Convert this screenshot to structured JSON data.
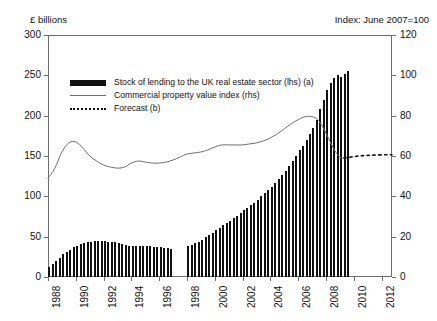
{
  "chart_data": {
    "type": "bar",
    "title": "",
    "left_axis_title": "£ billions",
    "right_axis_title": "Index: June 2007=100",
    "xlabel": "",
    "grid": false,
    "legend_position": "inside-top-left",
    "xlim": [
      1988,
      2012.75
    ],
    "ylim_left": [
      0,
      300
    ],
    "ylim_right": [
      0,
      120
    ],
    "left_ticks": [
      "0",
      "50",
      "100",
      "150",
      "200",
      "250",
      "300"
    ],
    "left_tick_values": [
      0,
      50,
      100,
      150,
      200,
      250,
      300
    ],
    "right_ticks": [
      "0",
      "20",
      "40",
      "60",
      "80",
      "100",
      "120"
    ],
    "right_tick_values": [
      0,
      20,
      40,
      60,
      80,
      100,
      120
    ],
    "x_ticks": [
      "1988",
      "1990",
      "1992",
      "1994",
      "1996",
      "1998",
      "2000",
      "2002",
      "2004",
      "2006",
      "2008",
      "2010",
      "2012"
    ],
    "x_tick_values": [
      1988,
      1990,
      1992,
      1994,
      1996,
      1998,
      2000,
      2002,
      2004,
      2006,
      2008,
      2010,
      2012
    ],
    "legend": [
      {
        "label": "Stock of lending to the UK real estate sector (lhs) (a)",
        "key": "bar-swatch"
      },
      {
        "label": "Commercial property value index (rhs)",
        "key": "line-swatch"
      },
      {
        "label": "Forecast (b)",
        "key": "dash-swatch"
      }
    ],
    "series": [
      {
        "name": "Stock of lending to the UK real estate sector (lhs) (a)",
        "type": "bar",
        "axis": "left",
        "units": "£ billions",
        "color": "#111111",
        "x": [
          1988.1,
          1988.35,
          1988.6,
          1988.85,
          1989.1,
          1989.35,
          1989.6,
          1989.85,
          1990.1,
          1990.35,
          1990.6,
          1990.85,
          1991.1,
          1991.35,
          1991.6,
          1991.85,
          1992.1,
          1992.35,
          1992.6,
          1992.85,
          1993.1,
          1993.35,
          1993.6,
          1993.85,
          1994.1,
          1994.35,
          1994.6,
          1994.85,
          1995.1,
          1995.35,
          1995.6,
          1995.85,
          1996.1,
          1996.35,
          1996.6,
          1996.85,
          1998.1,
          1998.35,
          1998.6,
          1998.85,
          1999.1,
          1999.35,
          1999.6,
          1999.85,
          2000.1,
          2000.35,
          2000.6,
          2000.85,
          2001.1,
          2001.35,
          2001.6,
          2001.85,
          2002.1,
          2002.35,
          2002.6,
          2002.85,
          2003.1,
          2003.35,
          2003.6,
          2003.85,
          2004.1,
          2004.35,
          2004.6,
          2004.85,
          2005.1,
          2005.35,
          2005.6,
          2005.85,
          2006.1,
          2006.35,
          2006.6,
          2006.85,
          2007.1,
          2007.35,
          2007.6,
          2007.85,
          2008.1,
          2008.35,
          2008.6,
          2008.85,
          2009.1,
          2009.35,
          2009.6
        ],
        "values": [
          12,
          16,
          20,
          24,
          28,
          31,
          34,
          37,
          39,
          41,
          42,
          43,
          44,
          45,
          45,
          45,
          45,
          44,
          44,
          43,
          42,
          41,
          40,
          39,
          38,
          38,
          38,
          38,
          38,
          38,
          37,
          37,
          37,
          36,
          36,
          35,
          38,
          40,
          42,
          44,
          46,
          49,
          52,
          55,
          58,
          61,
          64,
          67,
          70,
          73,
          76,
          79,
          83,
          86,
          89,
          92,
          96,
          100,
          104,
          108,
          112,
          117,
          122,
          127,
          132,
          138,
          144,
          150,
          157,
          163,
          170,
          177,
          185,
          195,
          208,
          220,
          232,
          240,
          247,
          251,
          248,
          252,
          255
        ]
      },
      {
        "name": "Commercial property value index (rhs)",
        "type": "line",
        "axis": "right",
        "units": "index, June 2007=100",
        "color": "#6e6e6e",
        "x": [
          1988.0,
          1988.5,
          1989.0,
          1989.5,
          1990.0,
          1990.5,
          1991.0,
          1991.5,
          1992.0,
          1992.5,
          1993.0,
          1993.5,
          1994.0,
          1994.5,
          1995.0,
          1995.5,
          1996.0,
          1996.5,
          1997.0,
          1997.5,
          1998.0,
          1998.5,
          1999.0,
          1999.5,
          2000.0,
          2000.5,
          2001.0,
          2001.5,
          2002.0,
          2002.5,
          2003.0,
          2003.5,
          2004.0,
          2004.5,
          2005.0,
          2005.5,
          2006.0,
          2006.5,
          2007.0,
          2007.4,
          2007.8,
          2008.2,
          2008.6,
          2009.0,
          2009.3
        ],
        "values": [
          49.0,
          54.0,
          62.0,
          66.5,
          67.0,
          64.0,
          60.0,
          57.5,
          55.5,
          54.5,
          54.0,
          54.5,
          56.5,
          57.5,
          57.0,
          56.5,
          56.5,
          57.0,
          58.0,
          59.5,
          61.0,
          61.5,
          62.0,
          63.0,
          64.5,
          65.5,
          65.5,
          65.5,
          65.5,
          66.0,
          66.5,
          67.5,
          69.0,
          71.0,
          73.5,
          76.0,
          78.0,
          79.5,
          79.5,
          78.0,
          74.0,
          68.5,
          63.0,
          59.5,
          59.0
        ]
      },
      {
        "name": "Forecast (b)",
        "type": "line-dotted",
        "axis": "right",
        "units": "index, June 2007=100",
        "color": "#111111",
        "x": [
          2009.3,
          2009.8,
          2010.4,
          2011.0,
          2011.6,
          2012.3,
          2012.75
        ],
        "values": [
          59.0,
          59.5,
          60.0,
          60.3,
          60.5,
          60.6,
          60.6
        ]
      }
    ]
  }
}
